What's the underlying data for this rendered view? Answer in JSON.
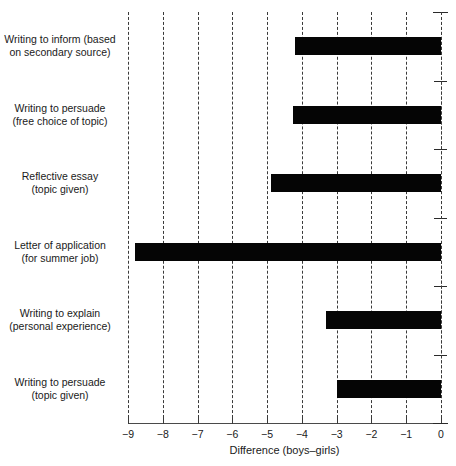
{
  "chart_data": {
    "type": "bar",
    "orientation": "horizontal",
    "title": "",
    "subtitle": "",
    "xlabel": "Difference (boys–girls)",
    "ylabel": "",
    "xlim": [
      -9,
      0
    ],
    "xticks": [
      -9,
      -8,
      -7,
      -6,
      -5,
      -4,
      -3,
      -2,
      -1,
      0
    ],
    "xtick_labels": [
      "−9",
      "−8",
      "−7",
      "−6",
      "−5",
      "−4",
      "−3",
      "−2",
      "−1",
      "0"
    ],
    "grid": true,
    "grid_axis": "x",
    "grid_style": "dashed",
    "legend": false,
    "legend_position": "none",
    "bar_color": "#050505",
    "categories": [
      "Writing to inform (based on secondary source)",
      "Writing to persuade (free choice of topic)",
      "Reflective essay (topic given)",
      "Letter of application (for summer job)",
      "Writing to explain (personal experience)",
      "Writing to persuade (topic given)"
    ],
    "category_lines": [
      [
        "Writing to inform (based",
        "on secondary source)"
      ],
      [
        "Writing to persuade",
        "(free choice of topic)"
      ],
      [
        "Reflective essay",
        "(topic given)"
      ],
      [
        "Letter of application",
        "(for summer job)"
      ],
      [
        "Writing to explain",
        "(personal experience)"
      ],
      [
        "Writing to persuade",
        "(topic given)"
      ]
    ],
    "values": [
      -4.2,
      -4.25,
      -4.9,
      -8.8,
      -3.3,
      -3.0
    ]
  }
}
